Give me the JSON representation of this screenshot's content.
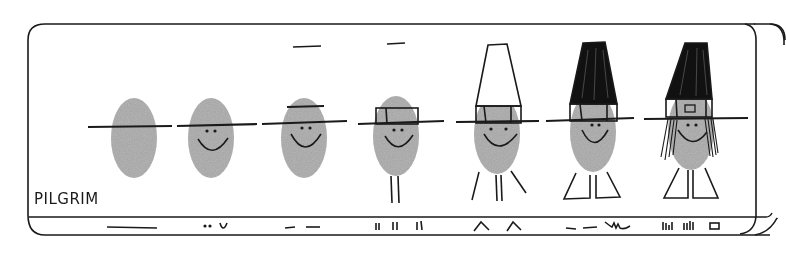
{
  "title": "PILGRIM",
  "colors": {
    "ink": "#1a1a1a",
    "thumbprint": "#a8a8a8",
    "background": "#ffffff"
  },
  "steps": [
    {
      "index": 1,
      "description": "Thumbprint with horizontal line (hat brim)",
      "legend_strokes": "long dash"
    },
    {
      "index": 2,
      "description": "Add eyes and smile",
      "legend_strokes": "dot dot smile"
    },
    {
      "index": 3,
      "description": "Add line for hat crown base and raised brim line",
      "legend_strokes": "two dashes"
    },
    {
      "index": 4,
      "description": "Add hat band rectangle and legs",
      "legend_strokes": "vertical tick pairs"
    },
    {
      "index": 5,
      "description": "Add tall crown outline and angled legs/arms",
      "legend_strokes": "two chevrons"
    },
    {
      "index": 6,
      "description": "Fill hat black and add shoe shapes",
      "legend_strokes": "dashes and zigzag"
    },
    {
      "index": 7,
      "description": "Add hair strands and buckle",
      "legend_strokes": "hatch marks and square"
    }
  ]
}
